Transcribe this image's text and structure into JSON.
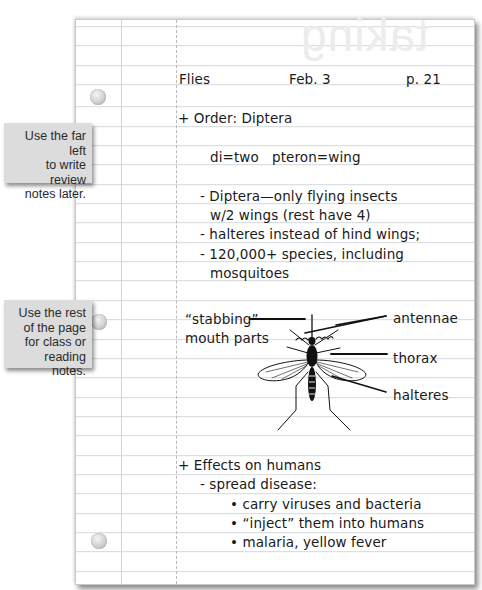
{
  "watermark": "taking",
  "callouts": [
    {
      "lines": [
        "Use the far left",
        "to write review",
        "notes later."
      ]
    },
    {
      "lines": [
        "Use the rest",
        "of the page",
        "for class or",
        "reading notes."
      ]
    }
  ],
  "notes": {
    "header": {
      "topic": "Flies",
      "date": "Feb. 3",
      "page": "p. 21"
    },
    "order": "+ Order: Diptera",
    "etymology": "di=two   pteron=wing",
    "facts": [
      "- Diptera—only flying insects",
      "w/2 wings (rest have 4)",
      "- halteres instead of hind wings;",
      "- 120,000+ species, including",
      "mosquitoes"
    ],
    "diagram": {
      "subject": "mosquito",
      "labels": {
        "mouth_line1": "“stabbing”",
        "mouth_line2": "mouth parts",
        "antennae": "antennae",
        "thorax": "thorax",
        "halteres": "halteres"
      }
    },
    "effects": {
      "heading": "+ Effects on humans",
      "sub": "- spread disease:",
      "bullets": [
        "• carry viruses and bacteria",
        "• “inject” them into humans",
        "• malaria, yellow fever"
      ]
    }
  },
  "colors": {
    "paper": "#ffffff",
    "rule": "#d4d7da",
    "callout_bg": "#dcdcdc",
    "ink": "#1a1a1a"
  }
}
